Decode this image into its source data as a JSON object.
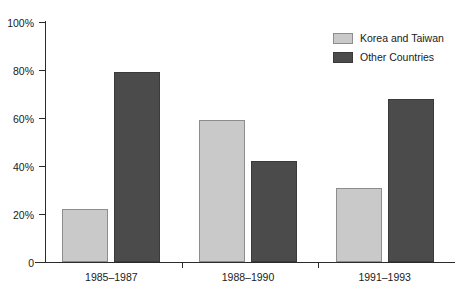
{
  "chart_data": {
    "type": "bar",
    "title": "",
    "subtitle": "",
    "xlabel": "",
    "ylabel": "",
    "categories": [
      "1985–1987",
      "1988–1990",
      "1991–1993"
    ],
    "series": [
      {
        "name": "Korea and Taiwan",
        "color": "#c9c9c9",
        "values": [
          22,
          59,
          31
        ]
      },
      {
        "name": "Other Countries",
        "color": "#4b4b4b",
        "values": [
          79,
          42,
          68
        ]
      }
    ],
    "ylim": [
      0,
      100
    ],
    "yticks": [
      0,
      20,
      40,
      60,
      80,
      100
    ],
    "ytick_labels": [
      "0",
      "20%",
      "40%",
      "60%",
      "80%",
      "100%"
    ],
    "grid": false,
    "legend_position": "top-right",
    "bar_group_gap": true
  },
  "axes": {
    "y": {
      "ticks": [
        {
          "label": "100%",
          "value": 100
        },
        {
          "label": "80%",
          "value": 80
        },
        {
          "label": "60%",
          "value": 60
        },
        {
          "label": "40%",
          "value": 40
        },
        {
          "label": "20%",
          "value": 20
        },
        {
          "label": "0",
          "value": 0
        }
      ]
    },
    "x": {
      "ticks": [
        {
          "label": "1985–1987"
        },
        {
          "label": "1988–1990"
        },
        {
          "label": "1991–1993"
        }
      ]
    }
  },
  "legend": {
    "items": [
      {
        "label": "Korea and Taiwan",
        "color": "#c9c9c9"
      },
      {
        "label": "Other Countries",
        "color": "#4b4b4b"
      }
    ]
  },
  "clipped_header": {
    "text": ""
  }
}
